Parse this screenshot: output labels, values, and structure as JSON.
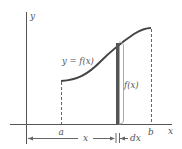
{
  "diagram": {
    "labels": {
      "y_axis": "y",
      "x_axis": "x",
      "curve": "y = f(x)",
      "strip_height": "f(x)",
      "a": "a",
      "b": "b",
      "x_distance": "x",
      "dx": "dx"
    },
    "colors": {
      "axis": "#555555",
      "curve": "#444444",
      "strip": "#555555",
      "bracket": "#aaaaaa",
      "dashed": "#666666",
      "text": "#555555"
    }
  }
}
